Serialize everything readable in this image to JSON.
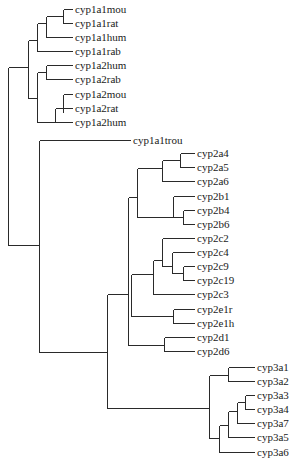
{
  "diagram": {
    "type": "phylogenetic-tree",
    "line_color": "#2a2a2a",
    "text_color": "#1a1a1a",
    "background": "#ffffff",
    "leaves": [
      {
        "label": "cyp1a1mou",
        "x": 75,
        "y": 9
      },
      {
        "label": "cyp1a1rat",
        "x": 75,
        "y": 23
      },
      {
        "label": "cyp1a1hum",
        "x": 75,
        "y": 37
      },
      {
        "label": "cyp1a1rab",
        "x": 75,
        "y": 51
      },
      {
        "label": "cyp1a2hum",
        "x": 75,
        "y": 65
      },
      {
        "label": "cyp1a2rab",
        "x": 75,
        "y": 79
      },
      {
        "label": "cyp1a2mou",
        "x": 75,
        "y": 94
      },
      {
        "label": "cyp1a2rat",
        "x": 75,
        "y": 108
      },
      {
        "label": "cyp1a2hum",
        "x": 75,
        "y": 122
      },
      {
        "label": "cyp1a1trou",
        "x": 133,
        "y": 140
      },
      {
        "label": "cyp2a4",
        "x": 197,
        "y": 153
      },
      {
        "label": "cyp2a5",
        "x": 197,
        "y": 167
      },
      {
        "label": "cyp2a6",
        "x": 197,
        "y": 181
      },
      {
        "label": "cyp2b1",
        "x": 197,
        "y": 196
      },
      {
        "label": "cyp2b4",
        "x": 197,
        "y": 210
      },
      {
        "label": "cyp2b6",
        "x": 197,
        "y": 224
      },
      {
        "label": "cyp2c2",
        "x": 197,
        "y": 238
      },
      {
        "label": "cyp2c4",
        "x": 197,
        "y": 252
      },
      {
        "label": "cyp2c9",
        "x": 197,
        "y": 266
      },
      {
        "label": "cyp2c19",
        "x": 197,
        "y": 280
      },
      {
        "label": "cyp2c3",
        "x": 197,
        "y": 294
      },
      {
        "label": "cyp2e1r",
        "x": 197,
        "y": 309
      },
      {
        "label": "cyp2e1h",
        "x": 197,
        "y": 323
      },
      {
        "label": "cyp2d1",
        "x": 197,
        "y": 337
      },
      {
        "label": "cyp2d6",
        "x": 197,
        "y": 351
      },
      {
        "label": "cyp3a1",
        "x": 257,
        "y": 367
      },
      {
        "label": "cyp3a2",
        "x": 257,
        "y": 381
      },
      {
        "label": "cyp3a3",
        "x": 257,
        "y": 395
      },
      {
        "label": "cyp3a4",
        "x": 257,
        "y": 409
      },
      {
        "label": "cyp3a7",
        "x": 257,
        "y": 423
      },
      {
        "label": "cyp3a5",
        "x": 257,
        "y": 437
      },
      {
        "label": "cyp3a6",
        "x": 257,
        "y": 452
      }
    ],
    "segments": [
      [
        8,
        67,
        8,
        245
      ],
      [
        8,
        245,
        39,
        245
      ],
      [
        8,
        67,
        28,
        67
      ],
      [
        28,
        40,
        28,
        98
      ],
      [
        28,
        40,
        37,
        40
      ],
      [
        37,
        23,
        37,
        51
      ],
      [
        37,
        23,
        46,
        23
      ],
      [
        37,
        51,
        72,
        51
      ],
      [
        46,
        16,
        46,
        37
      ],
      [
        46,
        37,
        72,
        37
      ],
      [
        46,
        16,
        63,
        16
      ],
      [
        63,
        9,
        63,
        23
      ],
      [
        63,
        9,
        72,
        9
      ],
      [
        63,
        23,
        72,
        23
      ],
      [
        28,
        98,
        37,
        98
      ],
      [
        37,
        72,
        37,
        122
      ],
      [
        37,
        72,
        46,
        72
      ],
      [
        46,
        65,
        46,
        79
      ],
      [
        46,
        65,
        72,
        65
      ],
      [
        46,
        79,
        72,
        79
      ],
      [
        37,
        122,
        55,
        122
      ],
      [
        55,
        108,
        55,
        122
      ],
      [
        55,
        108,
        63,
        108
      ],
      [
        55,
        122,
        72,
        122
      ],
      [
        63,
        94,
        63,
        112
      ],
      [
        63,
        94,
        72,
        94
      ],
      [
        63,
        108,
        72,
        108
      ],
      [
        39,
        140,
        39,
        352
      ],
      [
        39,
        140,
        130,
        140
      ],
      [
        39,
        352,
        107,
        352
      ],
      [
        107,
        294,
        107,
        408
      ],
      [
        107,
        294,
        128,
        294
      ],
      [
        128,
        197,
        128,
        345
      ],
      [
        128,
        197,
        137,
        197
      ],
      [
        137,
        168,
        137,
        217
      ],
      [
        137,
        168,
        162,
        168
      ],
      [
        162,
        160,
        162,
        181
      ],
      [
        162,
        181,
        194,
        181
      ],
      [
        162,
        160,
        180,
        160
      ],
      [
        180,
        153,
        180,
        167
      ],
      [
        180,
        153,
        194,
        153
      ],
      [
        180,
        167,
        194,
        167
      ],
      [
        137,
        217,
        173,
        217
      ],
      [
        173,
        196,
        173,
        217
      ],
      [
        173,
        196,
        194,
        196
      ],
      [
        173,
        217,
        183,
        217
      ],
      [
        183,
        210,
        183,
        224
      ],
      [
        183,
        210,
        194,
        210
      ],
      [
        183,
        224,
        194,
        224
      ],
      [
        128,
        345,
        131,
        345
      ],
      [
        131,
        274,
        131,
        316
      ],
      [
        131,
        274,
        153,
        274
      ],
      [
        153,
        260,
        153,
        294
      ],
      [
        153,
        294,
        194,
        294
      ],
      [
        153,
        260,
        162,
        260
      ],
      [
        162,
        238,
        162,
        266
      ],
      [
        162,
        238,
        194,
        238
      ],
      [
        162,
        266,
        172,
        266
      ],
      [
        172,
        252,
        172,
        273
      ],
      [
        172,
        252,
        194,
        252
      ],
      [
        172,
        273,
        183,
        273
      ],
      [
        183,
        266,
        183,
        280
      ],
      [
        183,
        266,
        194,
        266
      ],
      [
        183,
        280,
        194,
        280
      ],
      [
        131,
        316,
        173,
        316
      ],
      [
        173,
        309,
        173,
        323
      ],
      [
        173,
        309,
        194,
        309
      ],
      [
        173,
        323,
        194,
        323
      ],
      [
        128,
        345,
        164,
        345
      ],
      [
        164,
        337,
        164,
        351
      ],
      [
        164,
        337,
        194,
        337
      ],
      [
        164,
        351,
        194,
        351
      ],
      [
        107,
        408,
        209,
        408
      ],
      [
        209,
        375,
        209,
        438
      ],
      [
        209,
        375,
        228,
        375
      ],
      [
        228,
        367,
        228,
        381
      ],
      [
        228,
        367,
        254,
        367
      ],
      [
        228,
        381,
        254,
        381
      ],
      [
        209,
        438,
        219,
        438
      ],
      [
        219,
        425,
        219,
        452
      ],
      [
        219,
        452,
        254,
        452
      ],
      [
        219,
        425,
        228,
        425
      ],
      [
        228,
        411,
        228,
        437
      ],
      [
        228,
        437,
        254,
        437
      ],
      [
        228,
        411,
        237,
        411
      ],
      [
        237,
        402,
        237,
        423
      ],
      [
        237,
        423,
        254,
        423
      ],
      [
        237,
        402,
        245,
        402
      ],
      [
        245,
        395,
        245,
        409
      ],
      [
        245,
        395,
        254,
        395
      ],
      [
        245,
        409,
        254,
        409
      ]
    ]
  }
}
